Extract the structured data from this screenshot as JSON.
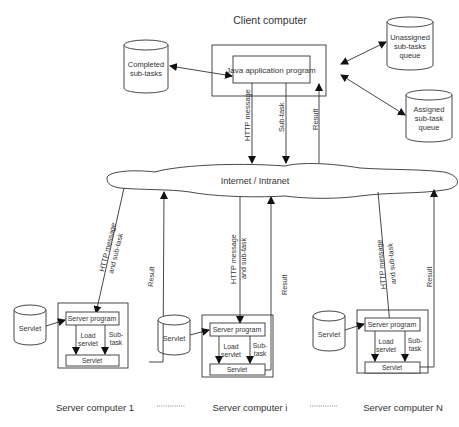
{
  "client": {
    "title": "Client computer",
    "program": "Java application program",
    "stores": {
      "completed": [
        "Completed",
        "sub-tasks"
      ],
      "unassigned": [
        "Unassigned",
        "sub-tasks",
        "queue"
      ],
      "assigned": [
        "Assigned",
        "sub-task",
        "queue"
      ]
    },
    "links": {
      "http": "HTTP message",
      "subtask": "Sub-task",
      "result": "Result"
    }
  },
  "network": {
    "label": "Internet  / Intranet"
  },
  "servers": [
    {
      "name": "Server computer 1",
      "store": "Servlet",
      "program": "Server program",
      "servlet": "Servlet",
      "load": [
        "Load",
        "servlet"
      ],
      "sub": [
        "Sub-",
        "task"
      ],
      "http": [
        "HTTP message",
        "and sub-task"
      ],
      "result": "Result"
    },
    {
      "name": "Server computer i",
      "store": "Servlet",
      "program": "Server program",
      "servlet": "Servlet",
      "load": [
        "Load",
        "servlet"
      ],
      "sub": [
        "Sub-",
        "task"
      ],
      "http": [
        "HTTP message",
        "and sub-task"
      ],
      "result": "Result"
    },
    {
      "name": "Server computer N",
      "store": "Servlet",
      "program": "Server program",
      "servlet": "Servlet",
      "load": [
        "Load",
        "servlet"
      ],
      "sub": [
        "Sub-",
        "task"
      ],
      "http": [
        "HTTP message",
        "and sub-task"
      ],
      "result": "Result"
    }
  ],
  "separator": "..............."
}
